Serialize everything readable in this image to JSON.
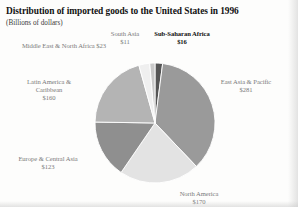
{
  "header": {
    "title": "Distribution of imported goods to the United States in 1996",
    "subtitle": "(Billions of dollars)"
  },
  "chart_data": {
    "type": "pie",
    "title": "Distribution of imported goods to the United States in 1996",
    "subtitle": "(Billions of dollars)",
    "unit": "billions of dollars",
    "legend": "none",
    "grid": false,
    "categories": [
      "Sub-Saharan Africa",
      "East Asia & Pacific",
      "North America",
      "Europe & Central Asia",
      "Latin America & Caribbean",
      "Middle East & North Africa",
      "South Asia"
    ],
    "values": [
      16,
      281,
      170,
      123,
      160,
      23,
      11
    ],
    "labels": [
      {
        "name": "Sub-Saharan Africa",
        "value_text": "$16",
        "emphasis": "bold"
      },
      {
        "name": "East Asia & Pacific",
        "value_text": "$281",
        "emphasis": "normal"
      },
      {
        "name": "North America",
        "value_text": "$170",
        "emphasis": "normal"
      },
      {
        "name": "Europe & Central Asia",
        "value_text": "$123",
        "emphasis": "normal"
      },
      {
        "name": "Latin America & Caribbean",
        "value_text": "$160",
        "emphasis": "normal"
      },
      {
        "name": "Middle East & North Africa",
        "value_text": "$23",
        "emphasis": "normal"
      },
      {
        "name": "South Asia",
        "value_text": "$11",
        "emphasis": "normal"
      }
    ],
    "slice_colors": [
      "#555555",
      "#9a9a9a",
      "#e3e3e3",
      "#8f8f8f",
      "#b4b4b4",
      "#efefef",
      "#c9c9c9"
    ],
    "start_angle_deg": 0,
    "direction": "clockwise"
  },
  "labels": {
    "south_asia": {
      "name": "South Asia",
      "value": "$11"
    },
    "sub_saharan_africa": {
      "name": "Sub-Saharan Africa",
      "value": "$16"
    },
    "middle_east_north_africa": {
      "name": "Middle East & North Africa $23"
    },
    "latin_america": {
      "name_line1": "Latin America &",
      "name_line2": "Caribbean",
      "value": "$160"
    },
    "east_asia_pacific": {
      "name": "East Asia & Pacific",
      "value": "$281"
    },
    "europe_central_asia": {
      "name": "Europe & Central Asia",
      "value": "$123"
    },
    "north_america": {
      "name": "North America",
      "value": "$170"
    }
  }
}
